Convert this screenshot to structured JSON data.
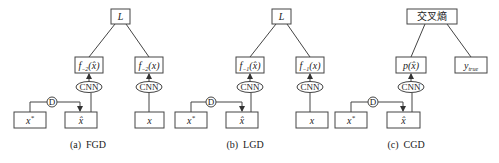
{
  "panels": [
    {
      "id": "a",
      "caption": "(a)  FGD",
      "top_label": "L",
      "left_func": {
        "prefix": "f",
        "sub": "−2",
        "arg": "(x̂)"
      },
      "right_func": {
        "prefix": "f",
        "sub": "−2",
        "arg": "(x)"
      },
      "cnn_label": "CNN",
      "d_label": "D",
      "input_star": {
        "base": "x",
        "sup": "*"
      },
      "input_hat": "x̂",
      "input_clean": "x"
    },
    {
      "id": "b",
      "caption": "(b)  LGD",
      "top_label": "L",
      "left_func": {
        "prefix": "f",
        "sub": "−1",
        "arg": "(x̂)"
      },
      "right_func": {
        "prefix": "f",
        "sub": "−1",
        "arg": "(x)"
      },
      "cnn_label": "CNN",
      "d_label": "D",
      "input_star": {
        "base": "x",
        "sup": "*"
      },
      "input_hat": "x̂",
      "input_clean": "x"
    },
    {
      "id": "c",
      "caption": "(c)  CGD",
      "top_label": "交叉熵",
      "left_func": {
        "prefix": "p",
        "arg": "(x̂)"
      },
      "right_label": {
        "base": "y",
        "sub": "true"
      },
      "cnn_label": "CNN",
      "d_label": "D",
      "input_star": {
        "base": "x",
        "sup": "*"
      },
      "input_hat": "x̂"
    }
  ]
}
